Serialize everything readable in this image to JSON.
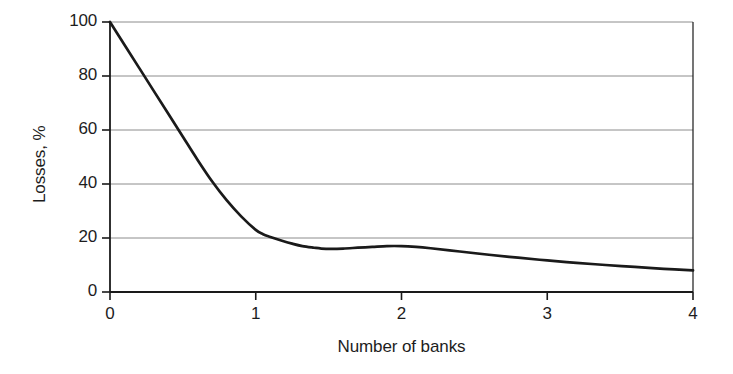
{
  "chart_data": {
    "type": "line",
    "title": "",
    "xlabel": "Number of banks",
    "ylabel": "Losses, %",
    "xlim": [
      0,
      4
    ],
    "ylim": [
      0,
      100
    ],
    "xticks": [
      0,
      1,
      2,
      3,
      4
    ],
    "yticks": [
      0,
      20,
      40,
      60,
      80,
      100
    ],
    "xtick_labels": [
      "0",
      "1",
      "2",
      "3",
      "4"
    ],
    "ytick_labels": [
      "0",
      "20",
      "40",
      "60",
      "80",
      "100"
    ],
    "grid": "horizontal",
    "legend": "none",
    "line_color": "#1a1a1a",
    "grid_color": "#8c8c8c",
    "axis_color": "#1a1a1a",
    "background_color": "#ffffff",
    "series": [
      {
        "name": "Losses",
        "x": [
          0.0,
          0.1,
          0.2,
          0.3,
          0.4,
          0.5,
          0.6,
          0.7,
          0.8,
          0.9,
          1.0,
          1.05,
          1.1,
          1.18,
          1.25,
          1.32,
          1.4,
          1.45,
          1.52,
          1.6,
          1.7,
          1.8,
          1.9,
          2.0,
          2.1,
          2.2,
          2.4,
          2.6,
          2.8,
          3.0,
          3.2,
          3.4,
          3.6,
          3.8,
          4.0
        ],
        "y": [
          100.0,
          91.5,
          83.0,
          74.5,
          66.0,
          57.5,
          49.0,
          41.0,
          34.0,
          28.0,
          23.0,
          21.4,
          20.4,
          19.0,
          17.9,
          17.0,
          16.4,
          16.1,
          16.0,
          16.1,
          16.4,
          16.7,
          17.0,
          17.0,
          16.7,
          16.2,
          15.0,
          13.8,
          12.7,
          11.7,
          10.8,
          10.0,
          9.3,
          8.6,
          8.0
        ]
      }
    ]
  }
}
